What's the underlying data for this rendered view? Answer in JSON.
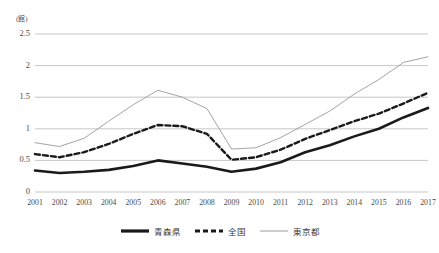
{
  "chart_data": {
    "type": "line",
    "title": "",
    "xlabel": "(年)",
    "ylabel": "(館)",
    "x": [
      2001,
      2002,
      2003,
      2004,
      2005,
      2006,
      2007,
      2008,
      2009,
      2010,
      2011,
      2012,
      2013,
      2014,
      2015,
      2016,
      2017
    ],
    "categories": [
      "2001",
      "2002",
      "2003",
      "2004",
      "2005",
      "2006",
      "2007",
      "2008",
      "2009",
      "2010",
      "2011",
      "2012",
      "2013",
      "2014",
      "2015",
      "2016",
      "2017"
    ],
    "ylim": [
      0,
      2.5
    ],
    "yticks": [
      0,
      0.5,
      1,
      1.5,
      2,
      2.5
    ],
    "ytick_labels": [
      "0",
      "0.5",
      "1",
      "1.5",
      "2",
      "2.5"
    ],
    "grid": true,
    "legend_position": "bottom",
    "series": [
      {
        "name": "青森県",
        "style": "solid-thick",
        "color": "#1a1a1a",
        "values": [
          0.34,
          0.3,
          0.32,
          0.35,
          0.41,
          0.5,
          0.45,
          0.4,
          0.32,
          0.37,
          0.47,
          0.63,
          0.74,
          0.88,
          1.0,
          1.18,
          1.33
        ]
      },
      {
        "name": "全国",
        "style": "dashed",
        "color": "#1a1a1a",
        "values": [
          0.6,
          0.55,
          0.63,
          0.76,
          0.92,
          1.06,
          1.04,
          0.92,
          0.51,
          0.55,
          0.67,
          0.84,
          0.98,
          1.12,
          1.24,
          1.4,
          1.57
        ]
      },
      {
        "name": "東京都",
        "style": "solid-thin",
        "color": "#9a9a9a",
        "values": [
          0.78,
          0.72,
          0.85,
          1.12,
          1.38,
          1.61,
          1.5,
          1.32,
          0.68,
          0.7,
          0.86,
          1.07,
          1.28,
          1.55,
          1.78,
          2.05,
          2.14
        ]
      }
    ]
  },
  "axis": {
    "unit_y": "(館)",
    "unit_x": "(年)"
  },
  "legend": {
    "items": [
      {
        "label": "青森県"
      },
      {
        "label": "全国"
      },
      {
        "label": "東京都"
      }
    ]
  }
}
